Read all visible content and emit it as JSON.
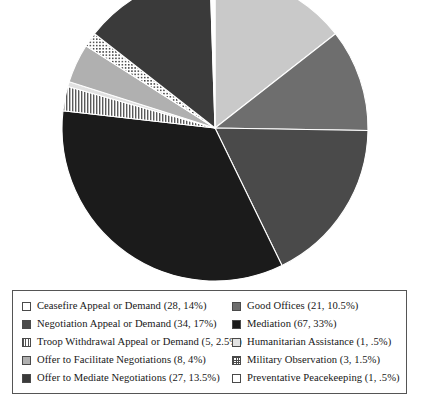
{
  "chart_data": {
    "type": "pie",
    "title": "",
    "subtitle": "",
    "xlabel": "",
    "ylabel": "",
    "total": 200,
    "start_angle_deg": 0,
    "direction": "clockwise",
    "legend_position": "bottom",
    "grid": false,
    "categories": [
      "Ceasefire Appeal or Demand",
      "Good Offices",
      "Negotiation Appeal or Demand",
      "Mediation",
      "Troop Withdrawal Appeal or Demand",
      "Humanitarian Assistance",
      "Offer to Facilitate Negotiations",
      "Military Observation",
      "Offer to Mediate Negotiations",
      "Preventative Peacekeeping"
    ],
    "values": [
      28,
      21,
      34,
      67,
      5,
      1,
      8,
      3,
      27,
      1
    ],
    "percentages": [
      14,
      10.5,
      17,
      33,
      2.5,
      0.5,
      4,
      1.5,
      13.5,
      0.5
    ],
    "slices": [
      {
        "label": "Ceasefire Appeal or Demand",
        "count": 28,
        "percent": 14,
        "color": "#c9c9c9",
        "pattern": "solid"
      },
      {
        "label": "Good Offices",
        "count": 21,
        "percent": 10.5,
        "color": "#6e6e6e",
        "pattern": "solid"
      },
      {
        "label": "Negotiation Appeal or Demand",
        "count": 34,
        "percent": 17,
        "color": "#4a4a4a",
        "pattern": "solid"
      },
      {
        "label": "Mediation",
        "count": 67,
        "percent": 33,
        "color": "#1b1b1b",
        "pattern": "solid"
      },
      {
        "label": "Troop Withdrawal Appeal or Demand",
        "count": 5,
        "percent": 2.5,
        "color": "#ffffff",
        "pattern": "vstripe"
      },
      {
        "label": "Humanitarian Assistance",
        "count": 1,
        "percent": 0.5,
        "color": "#e2e2e2",
        "pattern": "solid"
      },
      {
        "label": "Offer to Facilitate Negotiations",
        "count": 8,
        "percent": 4,
        "color": "#b0b0b0",
        "pattern": "solid"
      },
      {
        "label": "Military Observation",
        "count": 3,
        "percent": 1.5,
        "color": "#ffffff",
        "pattern": "checker"
      },
      {
        "label": "Offer to Mediate Negotiations",
        "count": 27,
        "percent": 13.5,
        "color": "#3a3a3a",
        "pattern": "solid"
      },
      {
        "label": "Preventative Peacekeeping",
        "count": 1,
        "percent": 0.5,
        "color": "#ffffff",
        "pattern": "empty"
      }
    ]
  },
  "legend": {
    "columns": [
      {
        "items": [
          {
            "text": "Ceasefire Appeal or Demand (28, 14%)",
            "fill": "empty",
            "color": "#ffffff"
          },
          {
            "text": "Negotiation Appeal or Demand (34, 17%)",
            "fill": "solid",
            "color": "#4a4a4a"
          },
          {
            "text": "Troop Withdrawal Appeal or Demand (5, 2.5%)",
            "fill": "vstripe",
            "color": "#ffffff"
          },
          {
            "text": "Offer to Facilitate Negotiations (8, 4%)",
            "fill": "solid",
            "color": "#b0b0b0"
          },
          {
            "text": "Offer to Mediate Negotiations (27, 13.5%)",
            "fill": "solid",
            "color": "#3a3a3a"
          }
        ]
      },
      {
        "items": [
          {
            "text": "Good Offices (21, 10.5%)",
            "fill": "solid",
            "color": "#6e6e6e"
          },
          {
            "text": "Mediation (67, 33%)",
            "fill": "solid",
            "color": "#1b1b1b"
          },
          {
            "text": "Humanitarian Assistance (1, .5%)",
            "fill": "solid",
            "color": "#e2e2e2"
          },
          {
            "text": "Military Observation (3, 1.5%)",
            "fill": "checker",
            "color": "#ffffff"
          },
          {
            "text": "Preventative Peacekeeping (1, .5%)",
            "fill": "empty",
            "color": "#ffffff"
          }
        ]
      }
    ]
  },
  "pie_geometry": {
    "center_x": 215,
    "center_y": 128,
    "radius": 153,
    "stroke": "#ffffff",
    "stroke_width": 1.1
  }
}
